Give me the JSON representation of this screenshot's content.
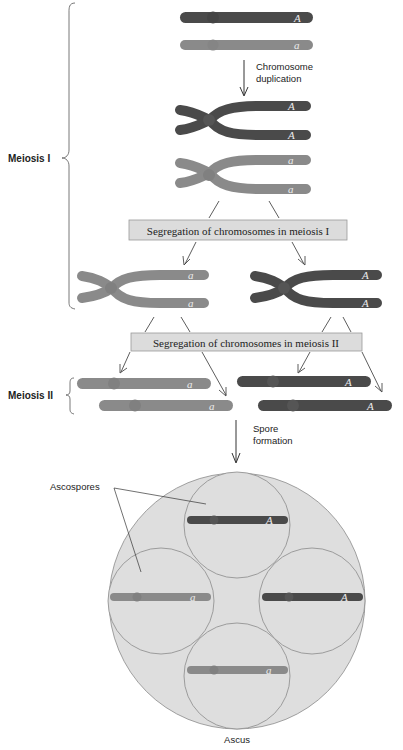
{
  "colors": {
    "dark_chromosome": "#4a4a4a",
    "light_chromosome": "#8a8a8a",
    "box_fill": "#dcdcdc",
    "ascus_fill": "#dedede",
    "line": "#333333"
  },
  "labels": {
    "chromosome_duplication_1": "Chromosome",
    "chromosome_duplication_2": "duplication",
    "meiosis_1": "Meiosis I",
    "meiosis_2": "Meiosis II",
    "segregation_1": "Segregation of chromosomes in meiosis I",
    "segregation_2": "Segregation of chromosomes in meiosis II",
    "spore_formation_1": "Spore",
    "spore_formation_2": "formation",
    "ascospores": "Ascospores",
    "ascus": "Ascus"
  },
  "alleles": {
    "dominant": "A",
    "recessive": "a"
  }
}
